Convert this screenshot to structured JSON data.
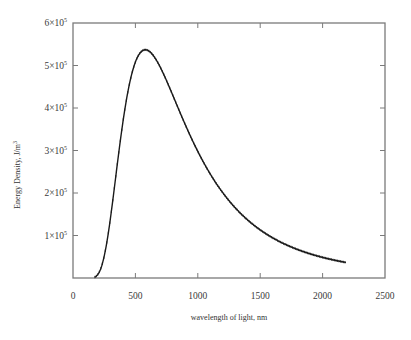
{
  "chart_data": {
    "type": "line",
    "title": "",
    "xlabel": "wavelength of light, nm",
    "ylabel": "Energy Density, J/m³",
    "xlim": [
      0,
      2500
    ],
    "ylim": [
      0,
      600000
    ],
    "grid": false,
    "legend": null,
    "x_ticks": [
      0,
      500,
      1000,
      1500,
      2000,
      2500
    ],
    "x_tick_labels": [
      "0",
      "500",
      "1000",
      "1500",
      "2000",
      "2500"
    ],
    "y_ticks": [
      100000,
      200000,
      300000,
      400000,
      500000,
      600000
    ],
    "y_tick_labels": [
      "1×10⁵",
      "2×10⁵",
      "3×10⁵",
      "4×10⁵",
      "5×10⁵",
      "6×10⁵"
    ],
    "series": [
      {
        "name": "Energy density (blackbody spectrum)",
        "color": "#1a1a1a",
        "marker": "small tick marks along curve",
        "x": [
          175,
          200,
          250,
          300,
          350,
          400,
          450,
          500,
          550,
          580,
          600,
          650,
          700,
          750,
          800,
          900,
          1000,
          1100,
          1200,
          1300,
          1400,
          1500,
          1600,
          1700,
          1800,
          1900,
          2000,
          2100,
          2190
        ],
        "y": [
          2000,
          8000,
          45000,
          122000,
          225000,
          330000,
          420000,
          485000,
          523000,
          537000,
          535000,
          526000,
          505000,
          478000,
          447000,
          382000,
          323000,
          272000,
          229000,
          193000,
          164000,
          140000,
          120000,
          104000,
          90000,
          78000,
          68000,
          60000,
          38000
        ]
      }
    ]
  },
  "y_label_text": "Energy Density, J/m",
  "y_label_sup": "3",
  "x_label_text": "wavelength of light, nm"
}
